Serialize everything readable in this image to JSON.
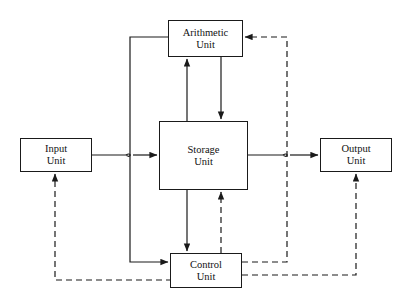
{
  "diagram": {
    "canvas": {
      "width": 407,
      "height": 305,
      "background": "#ffffff"
    },
    "style": {
      "line_color": "#1a1a1a",
      "solid_label": "data flow",
      "dashed_label": "control flow",
      "dash_pattern": "6,4"
    },
    "units": [
      {
        "id": "input-unit",
        "line1": "Input",
        "line2": "Unit",
        "x": 20,
        "y": 138,
        "w": 72,
        "h": 34
      },
      {
        "id": "arithmetic-unit",
        "line1": "Arithmetic",
        "line2": "Unit",
        "x": 168,
        "y": 20,
        "w": 75,
        "h": 37
      },
      {
        "id": "storage-unit",
        "line1": "Storage",
        "line2": "Unit",
        "x": 159,
        "y": 121,
        "w": 89,
        "h": 69
      },
      {
        "id": "output-unit",
        "line1": "Output",
        "line2": "Unit",
        "x": 320,
        "y": 138,
        "w": 72,
        "h": 34
      },
      {
        "id": "control-unit",
        "line1": "Control",
        "line2": "Unit",
        "x": 170,
        "y": 253,
        "w": 72,
        "h": 35
      }
    ],
    "connections": [
      {
        "id": "input-to-storage",
        "type": "solid",
        "from": "input-unit",
        "to": "storage-unit"
      },
      {
        "id": "storage-to-output",
        "type": "solid",
        "from": "storage-unit",
        "to": "output-unit"
      },
      {
        "id": "storage-to-arithmetic",
        "type": "solid",
        "from": "storage-unit",
        "to": "arithmetic-unit"
      },
      {
        "id": "arithmetic-to-storage",
        "type": "solid",
        "from": "arithmetic-unit",
        "to": "storage-unit"
      },
      {
        "id": "arithmetic-to-control",
        "type": "solid",
        "from": "arithmetic-unit",
        "to": "control-unit"
      },
      {
        "id": "storage-to-control",
        "type": "solid",
        "from": "storage-unit",
        "to": "control-unit"
      },
      {
        "id": "control-to-storage",
        "type": "dashed",
        "from": "control-unit",
        "to": "storage-unit"
      },
      {
        "id": "control-to-arithmetic",
        "type": "dashed",
        "from": "control-unit",
        "to": "arithmetic-unit"
      },
      {
        "id": "control-to-output",
        "type": "dashed",
        "from": "control-unit",
        "to": "output-unit"
      },
      {
        "id": "control-to-input",
        "type": "dashed",
        "from": "control-unit",
        "to": "input-unit"
      }
    ],
    "crossings": [
      {
        "id": "hop-left",
        "x": 130,
        "y": 155
      },
      {
        "id": "hop-right",
        "x": 287,
        "y": 155
      }
    ]
  }
}
